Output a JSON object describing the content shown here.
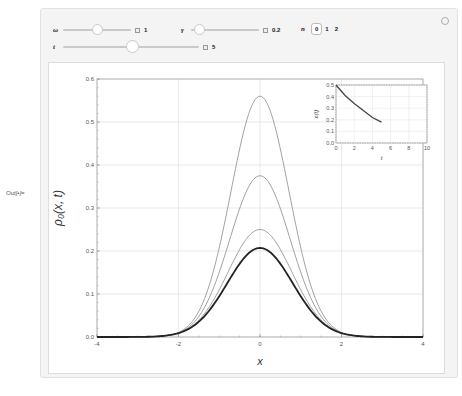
{
  "output_label": "Out[•]=",
  "controls": {
    "omega": {
      "label": "ω",
      "value": "1",
      "slider_fraction": 0.5
    },
    "gamma": {
      "label": "γ",
      "value": "0.2",
      "slider_fraction": 0.1
    },
    "t": {
      "label": "t",
      "value": "5",
      "slider_fraction": 0.5
    },
    "n": {
      "label": "n",
      "options": [
        "0",
        "1",
        "2"
      ],
      "selected": "0"
    }
  },
  "icons": {
    "options": "gear-icon",
    "add": "plus-icon"
  },
  "chart_data": [
    {
      "type": "line",
      "title": "",
      "xlabel": "x",
      "ylabel": "ρ₀(x, t)",
      "xlim": [
        -4,
        4
      ],
      "ylim": [
        0,
        0.6
      ],
      "xticks": [
        "-4",
        "-2",
        "0",
        "2",
        "4"
      ],
      "yticks": [
        "0.0",
        "0.1",
        "0.2",
        "0.3",
        "0.4",
        "0.5",
        "0.6"
      ],
      "grid": true,
      "series": [
        {
          "name": "curve-1",
          "peak": 0.56,
          "sigma": 0.71,
          "color": "#8a8a8a",
          "width": 0.8
        },
        {
          "name": "curve-2",
          "peak": 0.375,
          "sigma": 0.74,
          "color": "#8a8a8a",
          "width": 0.8
        },
        {
          "name": "curve-3",
          "peak": 0.25,
          "sigma": 0.78,
          "color": "#8a8a8a",
          "width": 0.8
        },
        {
          "name": "curve-4 (current t)",
          "peak": 0.207,
          "sigma": 0.8,
          "color": "#222222",
          "width": 1.8
        }
      ]
    },
    {
      "type": "line",
      "title": "inset",
      "xlabel": "t",
      "ylabel": "ε(t)",
      "xlim": [
        0,
        10
      ],
      "ylim": [
        0,
        0.5
      ],
      "xticks": [
        "0",
        "2",
        "4",
        "6",
        "8",
        "10"
      ],
      "yticks": [
        "0.0",
        "0.1",
        "0.2",
        "0.3",
        "0.4",
        "0.5"
      ],
      "grid": true,
      "x": [
        0,
        1,
        2,
        3,
        4,
        5
      ],
      "values": [
        0.5,
        0.41,
        0.34,
        0.28,
        0.22,
        0.18
      ]
    }
  ]
}
